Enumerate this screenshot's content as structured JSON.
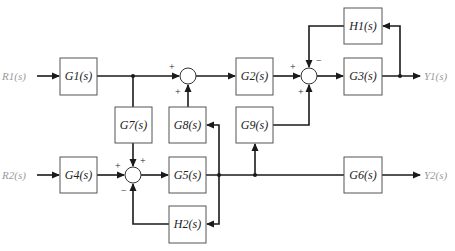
{
  "inputs": {
    "r1": "R1(s)",
    "r2": "R2(s)"
  },
  "outputs": {
    "y1": "Y1(s)",
    "y2": "Y2(s)"
  },
  "blocks": {
    "g1": "G1(s)",
    "g2": "G2(s)",
    "g3": "G3(s)",
    "g4": "G4(s)",
    "g5": "G5(s)",
    "g6": "G6(s)",
    "g7": "G7(s)",
    "g8": "G8(s)",
    "g9": "G9(s)",
    "h1": "H1(s)",
    "h2": "H2(s)"
  },
  "signs": {
    "sum1_left": "+",
    "sum1_bottom": "+",
    "sum2_left": "+",
    "sum2_top": "−",
    "sum2_bottom": "+",
    "sum3_left": "+",
    "sum3_top": "+",
    "sum3_bottom": "−"
  },
  "colors": {
    "wire": "#1a1a1a",
    "block_border": "#555555",
    "io_text": "#9a9a9a"
  }
}
